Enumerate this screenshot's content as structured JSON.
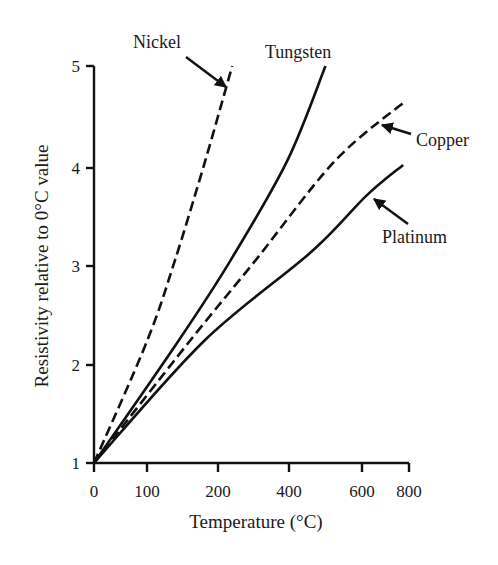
{
  "chart_data": {
    "type": "line",
    "title": "",
    "xlabel": "Temperature (°C)",
    "ylabel": "Resistivity relative to 0°C value",
    "x_ticks": [
      0,
      100,
      200,
      400,
      600,
      800
    ],
    "x_tick_labels": [
      "0",
      "100",
      "200",
      "400",
      "600",
      "800"
    ],
    "y_ticks": [
      1,
      2,
      3,
      4,
      5
    ],
    "y_tick_labels": [
      "1",
      "2",
      "3",
      "4",
      "5"
    ],
    "xlim": [
      0,
      800
    ],
    "ylim": [
      1,
      5
    ],
    "grid": false,
    "legend": "none (series labelled directly with arrows)",
    "x_scale_note": "non-uniform tick spacing (0,100,200,400,600,800)",
    "series": [
      {
        "name": "Nickel",
        "style": "dashed",
        "points": [
          [
            0,
            1.0
          ],
          [
            100,
            2.24
          ],
          [
            139,
            3.05
          ],
          [
            182,
            4.07
          ],
          [
            240,
            5.0
          ]
        ]
      },
      {
        "name": "Tungsten",
        "style": "solid",
        "points": [
          [
            0,
            1.0
          ],
          [
            144,
            2.24
          ],
          [
            234,
            3.05
          ],
          [
            395,
            4.07
          ],
          [
            500,
            5.0
          ]
        ]
      },
      {
        "name": "Copper",
        "style": "dashed",
        "points": [
          [
            0,
            1.0
          ],
          [
            160,
            2.24
          ],
          [
            304,
            3.05
          ],
          [
            526,
            4.07
          ],
          [
            787,
            4.66
          ]
        ]
      },
      {
        "name": "Platinum",
        "style": "solid",
        "points": [
          [
            0,
            1.0
          ],
          [
            180,
            2.24
          ],
          [
            463,
            3.15
          ],
          [
            620,
            3.72
          ],
          [
            775,
            4.03
          ]
        ]
      }
    ],
    "annotations": [
      {
        "text": "Nickel",
        "points_to": "Nickel"
      },
      {
        "text": "Tungsten",
        "points_to": "Tungsten"
      },
      {
        "text": "Copper",
        "points_to": "Copper"
      },
      {
        "text": "Platinum",
        "points_to": "Platinum"
      }
    ]
  },
  "labels": {
    "nickel": "Nickel",
    "tungsten": "Tungsten",
    "copper": "Copper",
    "platinum": "Platinum",
    "xlabel": "Temperature (°C)",
    "ylabel": "Resistivity relative to 0°C value"
  }
}
